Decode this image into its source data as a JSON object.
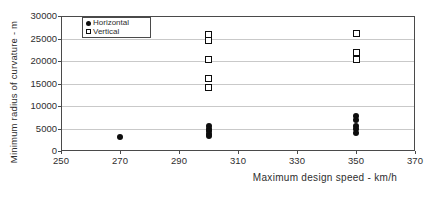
{
  "figure": {
    "background": "#ffffff",
    "frame_color": "#4a4a4a",
    "grid_color": "#c9c9c9",
    "text_color": "#2e2e2e",
    "marker_color": "#0d0d0d"
  },
  "chart_data": {
    "type": "scatter",
    "title": "",
    "xlabel": "Maximum design speed - km/h",
    "ylabel": "Minimum radius of curvature - m",
    "xlim": [
      250,
      370
    ],
    "ylim": [
      0,
      30000
    ],
    "x_ticks": [
      250,
      270,
      290,
      310,
      330,
      350,
      370
    ],
    "y_ticks": [
      0,
      5000,
      10000,
      15000,
      20000,
      25000,
      30000
    ],
    "grid": "horizontal-only",
    "legend_position": "top-left-inside",
    "series": [
      {
        "name": "Horizontal",
        "marker": "filled-circle",
        "points": [
          [
            270,
            3100
          ],
          [
            300,
            5600
          ],
          [
            300,
            5000
          ],
          [
            300,
            4400
          ],
          [
            300,
            3800
          ],
          [
            300,
            3300
          ],
          [
            350,
            7700
          ],
          [
            350,
            6900
          ],
          [
            350,
            5600
          ],
          [
            350,
            4800
          ],
          [
            350,
            4100
          ]
        ]
      },
      {
        "name": "Vertical",
        "marker": "open-square",
        "points": [
          [
            300,
            26000
          ],
          [
            300,
            24600
          ],
          [
            300,
            20300
          ],
          [
            300,
            16200
          ],
          [
            300,
            14200
          ],
          [
            350,
            26100
          ],
          [
            350,
            21900
          ],
          [
            350,
            20300
          ]
        ]
      }
    ]
  }
}
